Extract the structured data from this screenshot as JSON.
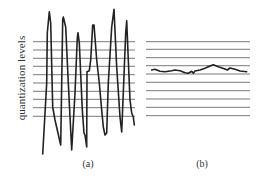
{
  "figure": {
    "ylabel": "quantization levels",
    "panels": [
      {
        "id": "a",
        "caption": "(a)"
      },
      {
        "id": "b",
        "caption": "(b)"
      }
    ]
  },
  "colors": {
    "level_line": "#7a7a7a",
    "waveform": "#222222",
    "text": "#333333"
  },
  "chart_data": [
    {
      "type": "line",
      "title": "(a)",
      "ylabel": "quantization levels",
      "description": "Large-amplitude signal spanning many quantization levels",
      "quantization_levels": 10,
      "level_y_px": [
        41.7,
        50,
        58.3,
        66.3,
        74.7,
        83,
        91.3,
        99.3,
        107.7,
        116.3
      ],
      "level_x_range_px": [
        33,
        135
      ],
      "signal_points_px": [
        [
          42.7,
          154
        ],
        [
          46.7,
          83
        ],
        [
          47.3,
          33
        ],
        [
          49.3,
          11.7
        ],
        [
          50.7,
          23
        ],
        [
          52.7,
          107
        ],
        [
          55,
          120
        ],
        [
          57.3,
          130
        ],
        [
          60.7,
          145
        ],
        [
          61.7,
          83
        ],
        [
          62.7,
          20
        ],
        [
          63.3,
          17
        ],
        [
          65.7,
          27
        ],
        [
          68.3,
          83
        ],
        [
          71.7,
          150
        ],
        [
          75,
          93
        ],
        [
          77.3,
          38
        ],
        [
          78,
          32.7
        ],
        [
          79.3,
          43
        ],
        [
          82.3,
          110
        ],
        [
          84,
          133
        ],
        [
          85,
          135
        ],
        [
          86.7,
          147
        ],
        [
          87,
          71.7
        ],
        [
          89.3,
          70.7
        ],
        [
          90.7,
          60
        ],
        [
          92.7,
          25
        ],
        [
          94,
          25
        ],
        [
          96.7,
          60
        ],
        [
          99.3,
          83
        ],
        [
          101.7,
          110
        ],
        [
          103.3,
          127
        ],
        [
          105,
          135
        ],
        [
          106.7,
          133
        ],
        [
          108.3,
          83
        ],
        [
          111.7,
          27
        ],
        [
          114,
          9.3
        ],
        [
          116.7,
          67
        ],
        [
          120,
          117
        ],
        [
          121.7,
          132
        ],
        [
          123.3,
          93
        ],
        [
          125.7,
          33
        ],
        [
          126.7,
          20.7
        ],
        [
          128.3,
          60
        ],
        [
          130,
          100
        ],
        [
          131.7,
          113
        ],
        [
          133.3,
          117
        ],
        [
          134.3,
          125
        ]
      ]
    },
    {
      "type": "line",
      "title": "(b)",
      "description": "Small-amplitude signal staying near a single quantization level",
      "quantization_levels": 10,
      "level_y_px": [
        41.7,
        49.3,
        57.7,
        65.7,
        74,
        82.3,
        90.7,
        99,
        107.3,
        115.7
      ],
      "level_x_range_px": [
        146,
        250
      ],
      "signal_points_px": [
        [
          151.7,
          70
        ],
        [
          155,
          69.3
        ],
        [
          160,
          71.3
        ],
        [
          165,
          71.7
        ],
        [
          171.7,
          70.7
        ],
        [
          175,
          70
        ],
        [
          180,
          70.7
        ],
        [
          185,
          72.7
        ],
        [
          188.3,
          73.3
        ],
        [
          191.7,
          71.3
        ],
        [
          193.3,
          73.3
        ],
        [
          195,
          71
        ],
        [
          200,
          70
        ],
        [
          205,
          68.3
        ],
        [
          210,
          66
        ],
        [
          213.3,
          64.7
        ],
        [
          218.3,
          66.7
        ],
        [
          225,
          69
        ],
        [
          227.3,
          70
        ],
        [
          230,
          68
        ],
        [
          235,
          69.3
        ],
        [
          240,
          71
        ],
        [
          246.7,
          71.7
        ]
      ]
    }
  ]
}
